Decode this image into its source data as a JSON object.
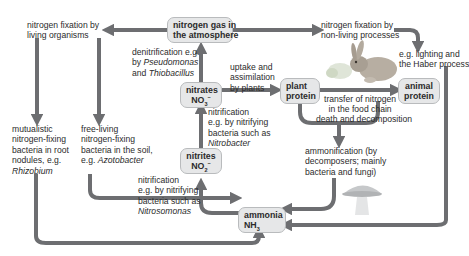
{
  "diagram": {
    "colors": {
      "arrow": "#6d6e71",
      "box_fill": "#e6e7e8",
      "box_border": "#b9bbbd",
      "text": "#2b2b2b"
    },
    "nodes": {
      "nitrogen_gas": {
        "line1": "nitrogen gas in",
        "line2": "the atmosphere"
      },
      "nitrates": {
        "line1": "nitrates",
        "formula": "NO",
        "sub": "3",
        "sup": "−"
      },
      "nitrites": {
        "line1": "nitrites",
        "formula": "NO",
        "sub": "2",
        "sup": "−"
      },
      "ammonia": {
        "line1": "ammonia",
        "formula": "NH",
        "sub": "3"
      },
      "plant_protein": {
        "line1": "plant",
        "line2": "protein"
      },
      "animal_protein": {
        "line1": "animal",
        "line2": "protein"
      }
    },
    "labels": {
      "fixation_living": {
        "line1": "nitrogen fixation by",
        "line2": "living organisms"
      },
      "fixation_nonliving": {
        "line1": "nitrogen fixation by",
        "line2": "non-living processes"
      },
      "lighting_haber": {
        "line1": "e.g. lighting and",
        "line2": "the Haber process"
      },
      "denitrification": {
        "line1": "denitrification e.g.",
        "line2a": "by ",
        "line2b": "Pseudomonas",
        "line3a": "and ",
        "line3b": "Thiobacillus"
      },
      "uptake": {
        "line1": "uptake and",
        "line2": "assimilation",
        "line3": "by plants"
      },
      "nitrification_nitrobacter": {
        "line1": "nitrification",
        "line2": "e.g. by nitrifying",
        "line3": "bacteria such as",
        "line4": "Nitrobacter"
      },
      "nitrification_nitrosomonas": {
        "line1": "nitrification",
        "line2": "e.g. by nitrifying",
        "line3": "bacteria such as",
        "line4": "Nitrosomonas"
      },
      "mutualistic": {
        "line1": "mutualistic",
        "line2": "nitrogen-fixing",
        "line3": "bacteria in root",
        "line4": "nodules, e.g.",
        "line5": "Rhizobium"
      },
      "free_living": {
        "line1": "free-living",
        "line2": "nitrogen-fixing",
        "line3": "bacteria in the soil,",
        "line4a": "e.g. ",
        "line4b": "Azotobacter"
      },
      "transfer": {
        "line1": "transfer of nitrogen",
        "line2": "in the food chain"
      },
      "death": {
        "line1": "death and decomposition"
      },
      "ammonification": {
        "line1": "ammonification  (by",
        "line2": "decomposers; mainly",
        "line3": "bacteria and fungi)"
      }
    },
    "illustrations": [
      "rabbit-eating-plant",
      "mushroom"
    ]
  }
}
